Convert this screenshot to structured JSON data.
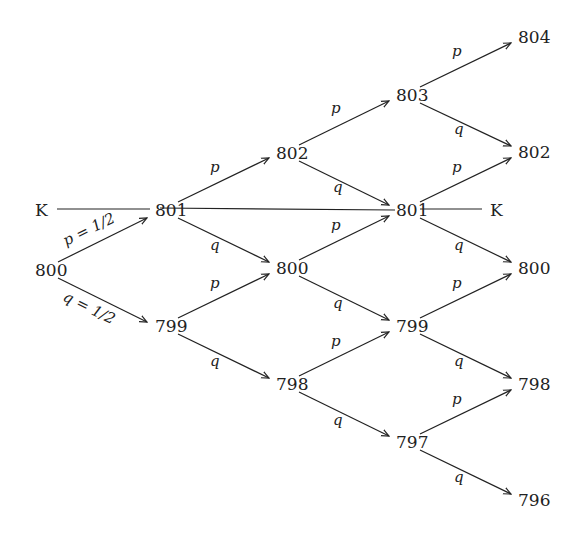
{
  "diagram": {
    "type": "binomial-tree",
    "strike_label": "K",
    "nodes": [
      {
        "id": "n0_0",
        "col": 0,
        "value": "800",
        "x": 35,
        "y": 270
      },
      {
        "id": "n1_0",
        "col": 1,
        "value": "801",
        "x": 155,
        "y": 210
      },
      {
        "id": "n1_1",
        "col": 1,
        "value": "799",
        "x": 155,
        "y": 326
      },
      {
        "id": "n2_0",
        "col": 2,
        "value": "802",
        "x": 276,
        "y": 153
      },
      {
        "id": "n2_1",
        "col": 2,
        "value": "800",
        "x": 276,
        "y": 268
      },
      {
        "id": "n2_2",
        "col": 2,
        "value": "798",
        "x": 276,
        "y": 384
      },
      {
        "id": "n3_0",
        "col": 3,
        "value": "803",
        "x": 396,
        "y": 95
      },
      {
        "id": "n3_1",
        "col": 3,
        "value": "801",
        "x": 396,
        "y": 210
      },
      {
        "id": "n3_2",
        "col": 3,
        "value": "799",
        "x": 396,
        "y": 326
      },
      {
        "id": "n3_3",
        "col": 3,
        "value": "797",
        "x": 396,
        "y": 442
      },
      {
        "id": "n4_0",
        "col": 4,
        "value": "804",
        "x": 518,
        "y": 37
      },
      {
        "id": "n4_1",
        "col": 4,
        "value": "802",
        "x": 518,
        "y": 152
      },
      {
        "id": "n4_2",
        "col": 4,
        "value": "800",
        "x": 518,
        "y": 268
      },
      {
        "id": "n4_3",
        "col": 4,
        "value": "798",
        "x": 518,
        "y": 384
      },
      {
        "id": "n4_4",
        "col": 4,
        "value": "796",
        "x": 518,
        "y": 500
      }
    ],
    "k_labels": [
      {
        "id": "k_left",
        "text": "K",
        "x": 35,
        "y": 210
      },
      {
        "id": "k_right",
        "text": "K",
        "x": 490,
        "y": 210
      }
    ],
    "edge_labels": {
      "up_first": "p = 1/2",
      "down_first": "q = 1/2",
      "up": "p",
      "down": "q"
    }
  }
}
